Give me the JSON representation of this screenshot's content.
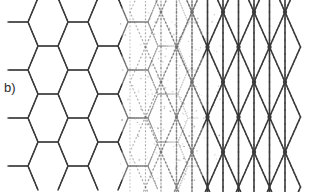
{
  "figure": {
    "panel_label": "b)",
    "caption_text": "",
    "background_color": "#ffffff",
    "width": 318,
    "height": 192
  },
  "chart_data": {
    "type": "diagram",
    "title": "",
    "subtitle": "",
    "xlabel": "",
    "ylabel": "",
    "panels": [
      {
        "label": "b)",
        "label_x": 4,
        "label_y": 80
      }
    ],
    "regions": [
      {
        "name": "honeycomb-region",
        "lattice": "honeycomb",
        "x_start": 28,
        "x_end": 138,
        "style": "solid",
        "color": "#3a3a3a",
        "line_width": 1.5,
        "opacity": 1.0
      },
      {
        "name": "transition-region",
        "lattice": "superposed",
        "x_start": 138,
        "x_end": 208,
        "style": "dotted",
        "color": "#6e6e6e",
        "line_width": 1.1,
        "opacity": 0.55
      },
      {
        "name": "triangular-region",
        "lattice": "triangular",
        "x_start": 195,
        "x_end": 292,
        "style": "solid",
        "color": "#3a3a3a",
        "line_width": 1.6,
        "opacity": 1.0
      }
    ],
    "geometry": {
      "hex_cell_width": 40,
      "hex_cell_height": 48,
      "hex_circumradius": 14,
      "hex_columns": 4,
      "hex_rows": 4,
      "tri_spacing_x": 31,
      "tri_spacing_y": 35,
      "tri_columns": 4,
      "tri_rows": 5,
      "node_marker_radius": 2.2,
      "content_top": 12,
      "content_bottom": 182
    },
    "colors": {
      "ink": "#3a3a3a",
      "faded_ink": "#6e6e6e",
      "background": "#ffffff",
      "label": "#2b2b2b"
    },
    "legend": [],
    "annotations": []
  }
}
